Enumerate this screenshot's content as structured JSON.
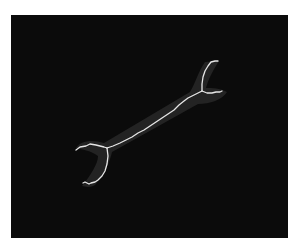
{
  "image": {
    "subject": "wrench skeleton",
    "background_color": "#0b0b0b",
    "silhouette_color": "#2a2a2a",
    "skeleton_color": "#e6e6e6"
  }
}
